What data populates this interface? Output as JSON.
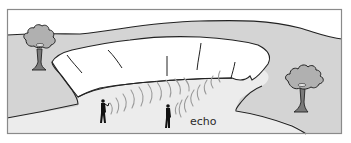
{
  "diagram": {
    "labels": {
      "echo": "echo"
    },
    "elements": [
      {
        "name": "left-tree",
        "kind": "tree"
      },
      {
        "name": "right-tree",
        "kind": "tree"
      },
      {
        "name": "cliff-face",
        "kind": "rock wall"
      },
      {
        "name": "person-caller",
        "kind": "person"
      },
      {
        "name": "person-listener",
        "kind": "person"
      },
      {
        "name": "sound-waves-outgoing",
        "kind": "sound arcs"
      },
      {
        "name": "sound-waves-echo",
        "kind": "sound arcs"
      }
    ],
    "colors": {
      "frame": "#8a8a8a",
      "ground_shaded": "#d4d4d4",
      "canyon_floor": "#ececec",
      "cliff": "#ffffff",
      "outline": "#222222",
      "tree_foliage": "#b0b0b0",
      "tree_trunk": "#7a7a7a",
      "waves": "#9a9a9a",
      "person": "#111111"
    }
  }
}
